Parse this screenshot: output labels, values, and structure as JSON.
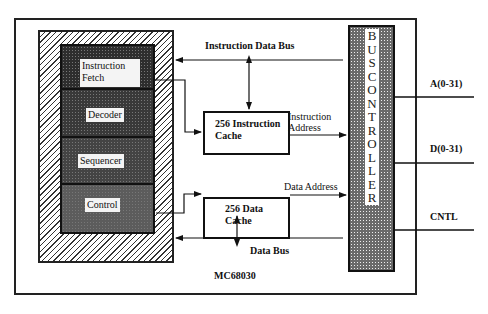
{
  "diagram": {
    "chip_label": "MC68030",
    "cpu_sections": [
      {
        "label": "Instruction Fetch"
      },
      {
        "label": "Decoder"
      },
      {
        "label": "Sequencer"
      },
      {
        "label": "Control"
      }
    ],
    "instruction_cache": {
      "line1": "256 Instruction",
      "line2": "Cache"
    },
    "data_cache": {
      "line1": "256 Data",
      "line2": "Cache"
    },
    "bus_controller": {
      "letters": "BUSCONTROLLER"
    },
    "buses": {
      "instruction_data_bus": "Instruction Data Bus",
      "data_bus": "Data Bus",
      "instruction_address_line1": "Instruction",
      "instruction_address_line2": "Address",
      "data_address": "Data Address"
    },
    "external_signals": {
      "address": "A(0-31)",
      "data": "D(0-31)",
      "control": "CNTL"
    }
  }
}
